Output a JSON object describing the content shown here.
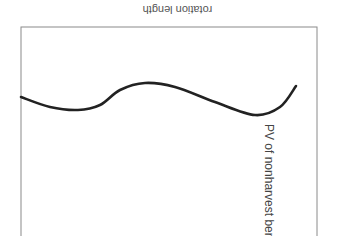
{
  "chart_data": {
    "type": "line",
    "title": "",
    "xlabel": "rotation length",
    "ylabel": "PV of nonharvest benefits",
    "orientation_note": "figure displayed rotated 180 degrees",
    "grid": false,
    "legend": null,
    "x_ticks": [],
    "y_ticks": [],
    "series": [
      {
        "name": "PV of nonharvest benefits",
        "color": "#222222",
        "points_px": [
          [
            21,
            97
          ],
          [
            50,
            107
          ],
          [
            78,
            110
          ],
          [
            100,
            105
          ],
          [
            120,
            90
          ],
          [
            145,
            83
          ],
          [
            175,
            87
          ],
          [
            215,
            102
          ],
          [
            255,
            115
          ],
          [
            280,
            107
          ],
          [
            296,
            86
          ]
        ]
      }
    ]
  },
  "colors": {
    "axis": "#888888",
    "line": "#222222",
    "text": "#555555"
  }
}
